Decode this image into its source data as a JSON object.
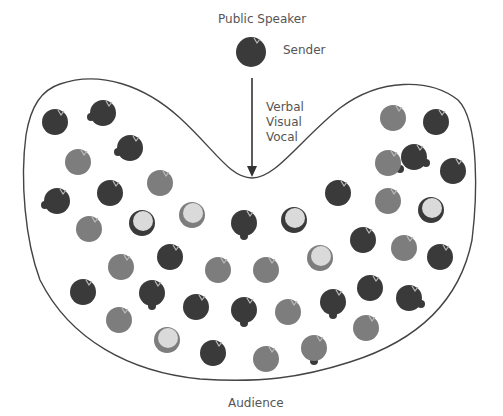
{
  "title": "Public Speaker",
  "sender_label": "Sender",
  "channels": [
    "Verbal",
    "Visual",
    "Vocal"
  ],
  "audience_label": "Audience",
  "colors": {
    "dark": "#3a3a3a",
    "mid": "#7d7d7d",
    "light": "#dadada",
    "line": "#444444",
    "text": "#555555"
  },
  "sender": {
    "x": 251,
    "y": 52,
    "r": 15,
    "type": "dark"
  },
  "audience_members": [
    {
      "x": 55,
      "y": 122,
      "type": "dark"
    },
    {
      "x": 103,
      "y": 113,
      "type": "dark",
      "hand": "left"
    },
    {
      "x": 130,
      "y": 148,
      "type": "dark",
      "hand": "left"
    },
    {
      "x": 78,
      "y": 162,
      "type": "mid"
    },
    {
      "x": 160,
      "y": 183,
      "type": "mid"
    },
    {
      "x": 57,
      "y": 201,
      "type": "dark",
      "hand": "left"
    },
    {
      "x": 110,
      "y": 193,
      "type": "dark"
    },
    {
      "x": 142,
      "y": 223,
      "type": "lightdark"
    },
    {
      "x": 192,
      "y": 215,
      "type": "lightmid"
    },
    {
      "x": 244,
      "y": 223,
      "type": "dark",
      "hand": "down"
    },
    {
      "x": 294,
      "y": 220,
      "type": "lightdark"
    },
    {
      "x": 338,
      "y": 193,
      "type": "dark"
    },
    {
      "x": 388,
      "y": 201,
      "type": "mid"
    },
    {
      "x": 431,
      "y": 210,
      "type": "lightdark"
    },
    {
      "x": 393,
      "y": 118,
      "type": "mid"
    },
    {
      "x": 436,
      "y": 122,
      "type": "dark"
    },
    {
      "x": 388,
      "y": 163,
      "type": "mid",
      "hand": "right"
    },
    {
      "x": 414,
      "y": 157,
      "type": "dark",
      "hand": "right"
    },
    {
      "x": 453,
      "y": 171,
      "type": "dark"
    },
    {
      "x": 89,
      "y": 229,
      "type": "mid"
    },
    {
      "x": 121,
      "y": 267,
      "type": "mid"
    },
    {
      "x": 170,
      "y": 257,
      "type": "dark"
    },
    {
      "x": 218,
      "y": 270,
      "type": "mid"
    },
    {
      "x": 266,
      "y": 270,
      "type": "mid"
    },
    {
      "x": 320,
      "y": 258,
      "type": "lightmid"
    },
    {
      "x": 363,
      "y": 240,
      "type": "dark"
    },
    {
      "x": 404,
      "y": 248,
      "type": "mid"
    },
    {
      "x": 440,
      "y": 257,
      "type": "dark"
    },
    {
      "x": 83,
      "y": 292,
      "type": "dark"
    },
    {
      "x": 152,
      "y": 293,
      "type": "dark",
      "hand": "down"
    },
    {
      "x": 196,
      "y": 307,
      "type": "dark"
    },
    {
      "x": 244,
      "y": 310,
      "type": "dark",
      "hand": "down"
    },
    {
      "x": 288,
      "y": 312,
      "type": "mid"
    },
    {
      "x": 333,
      "y": 302,
      "type": "dark",
      "hand": "down"
    },
    {
      "x": 370,
      "y": 288,
      "type": "dark"
    },
    {
      "x": 409,
      "y": 298,
      "type": "dark",
      "hand": "right"
    },
    {
      "x": 119,
      "y": 320,
      "type": "mid"
    },
    {
      "x": 167,
      "y": 340,
      "type": "lightmid"
    },
    {
      "x": 213,
      "y": 353,
      "type": "dark"
    },
    {
      "x": 266,
      "y": 359,
      "type": "mid"
    },
    {
      "x": 314,
      "y": 348,
      "type": "mid",
      "hand": "down"
    },
    {
      "x": 366,
      "y": 328,
      "type": "mid"
    }
  ]
}
